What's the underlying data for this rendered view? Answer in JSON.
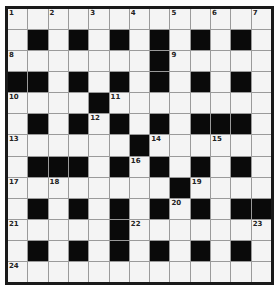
{
  "puzzle": {
    "rows": 13,
    "cols": 13,
    "colors": {
      "white": "#f4f4f4",
      "black": "#0a0a0a",
      "border": "#1a1a1a",
      "gridline": "#9a9a9a"
    },
    "grid": [
      ".............",
      ".#.#.#.#.#.#.",
      ".......#.....",
      "##.#.#.#.#.#.",
      "....#........",
      ".#.#.#.#.###.",
      "......#......",
      ".###.#.#.#.#.",
      "........#....",
      ".#.#.#.#.#.##",
      ".....#.......",
      ".#.#.#.#.#.#.",
      "............."
    ],
    "numbers": [
      {
        "r": 0,
        "c": 0,
        "n": "1"
      },
      {
        "r": 0,
        "c": 2,
        "n": "2"
      },
      {
        "r": 0,
        "c": 4,
        "n": "3"
      },
      {
        "r": 0,
        "c": 6,
        "n": "4"
      },
      {
        "r": 0,
        "c": 8,
        "n": "5"
      },
      {
        "r": 0,
        "c": 10,
        "n": "6"
      },
      {
        "r": 0,
        "c": 12,
        "n": "7"
      },
      {
        "r": 2,
        "c": 0,
        "n": "8"
      },
      {
        "r": 2,
        "c": 8,
        "n": "9"
      },
      {
        "r": 4,
        "c": 0,
        "n": "10"
      },
      {
        "r": 4,
        "c": 5,
        "n": "11"
      },
      {
        "r": 5,
        "c": 4,
        "n": "12"
      },
      {
        "r": 6,
        "c": 0,
        "n": "13"
      },
      {
        "r": 6,
        "c": 7,
        "n": "14"
      },
      {
        "r": 6,
        "c": 10,
        "n": "15"
      },
      {
        "r": 7,
        "c": 6,
        "n": "16"
      },
      {
        "r": 8,
        "c": 0,
        "n": "17"
      },
      {
        "r": 8,
        "c": 2,
        "n": "18"
      },
      {
        "r": 8,
        "c": 9,
        "n": "19"
      },
      {
        "r": 9,
        "c": 8,
        "n": "20"
      },
      {
        "r": 10,
        "c": 0,
        "n": "21"
      },
      {
        "r": 10,
        "c": 6,
        "n": "22"
      },
      {
        "r": 10,
        "c": 12,
        "n": "23"
      },
      {
        "r": 12,
        "c": 0,
        "n": "24"
      }
    ]
  }
}
